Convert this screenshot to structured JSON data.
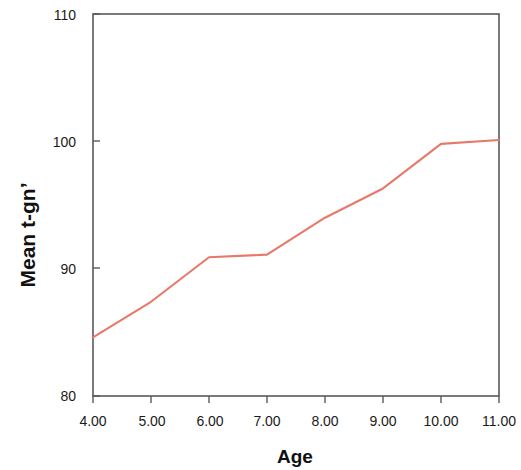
{
  "chart_data": {
    "type": "line",
    "title": "",
    "subtitle": "",
    "xlabel": "Age",
    "ylabel": "Mean t-gn’",
    "xlim": [
      4,
      11
    ],
    "ylim": [
      80,
      110
    ],
    "grid": false,
    "legend": null,
    "legend_position": "none",
    "x_tick_labels": [
      "4.00",
      "5.00",
      "6.00",
      "7.00",
      "8.00",
      "9.00",
      "10.00",
      "11.00"
    ],
    "y_tick_labels": [
      "80",
      "90",
      "100",
      "110"
    ],
    "x_ticks": [
      4,
      5,
      6,
      7,
      8,
      9,
      10,
      11
    ],
    "y_ticks": [
      80,
      90,
      100,
      110
    ],
    "x": [
      4,
      5,
      6,
      7,
      8,
      9,
      10,
      11
    ],
    "series": [
      {
        "name": "Mean t-gn’",
        "color": "#e8786a",
        "values": [
          84.6,
          87.4,
          90.9,
          91.1,
          94.0,
          96.3,
          99.8,
          100.1
        ]
      }
    ],
    "axis_color": "#595959",
    "text_color": "#1a1a1a",
    "background": "#ffffff"
  }
}
